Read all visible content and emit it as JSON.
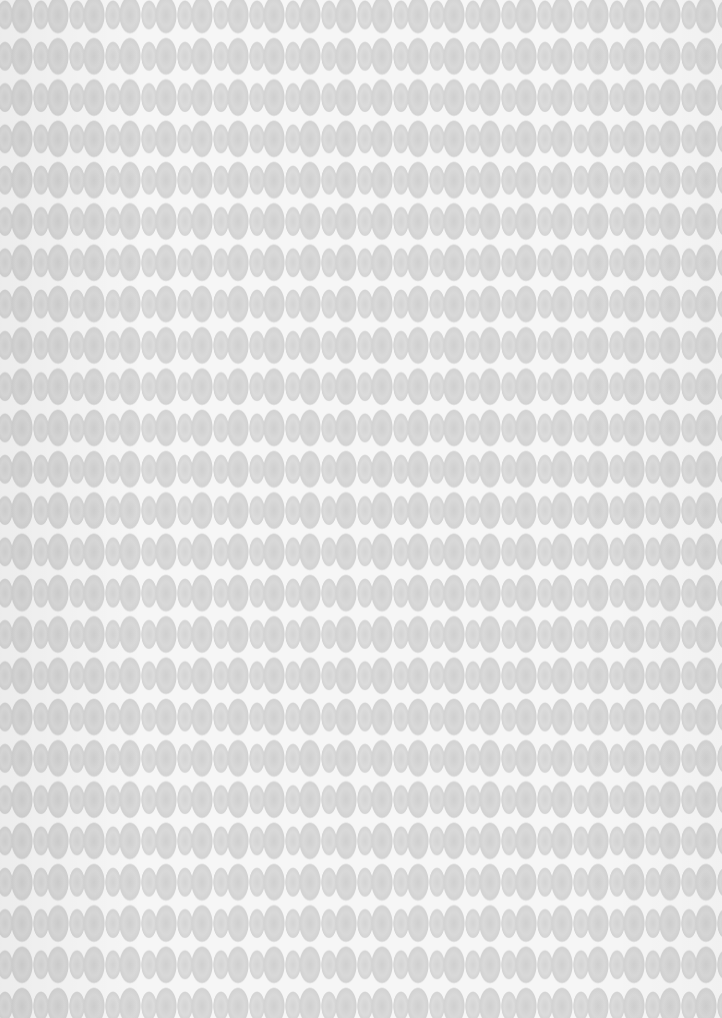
{
  "image": {
    "description": "Scanned paper with embossed repeating pattern of alternating large and small grey ovals on a white background",
    "colors": {
      "background": "#f6f6f6",
      "oval_large": "#d5d5d5",
      "oval_small": "#d9d9d9"
    },
    "pattern": {
      "row_period_px": 41,
      "column_period_px": 36,
      "rows": 25,
      "columns": 20
    }
  }
}
